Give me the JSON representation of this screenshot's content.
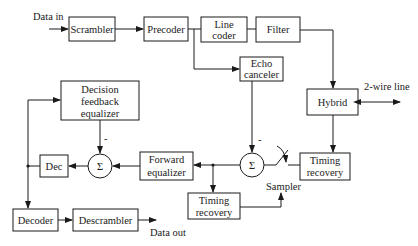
{
  "diagram": {
    "type": "block-diagram",
    "title": "",
    "labels": {
      "data_in": "Data in",
      "data_out": "Data out",
      "two_wire_line": "2-wire line",
      "sampler": "Sampler",
      "minus_sign": "-"
    },
    "blocks": {
      "scrambler": {
        "label": "Scrambler"
      },
      "precoder": {
        "label": "Precoder"
      },
      "line_coder": {
        "line1": "Line",
        "line2": "coder"
      },
      "filter": {
        "label": "Filter"
      },
      "echo_canceler": {
        "line1": "Echo",
        "line2": "canceler"
      },
      "hybrid": {
        "label": "Hybrid"
      },
      "dfe": {
        "line1": "Decision",
        "line2": "feedback",
        "line3": "equalizer"
      },
      "dec": {
        "label": "Dec"
      },
      "forward_equalizer": {
        "line1": "Forward",
        "line2": "equalizer"
      },
      "timing_recovery_upper": {
        "line1": "Timing",
        "line2": "recovery"
      },
      "timing_recovery_lower": {
        "line1": "Timing",
        "line2": "recovery"
      },
      "decoder": {
        "label": "Decoder"
      },
      "descrambler": {
        "label": "Descrambler"
      }
    },
    "summers": {
      "sum_dfe": {
        "symbol": "Σ"
      },
      "sum_echo": {
        "symbol": "Σ"
      }
    },
    "connections": [
      [
        "Data in",
        "Scrambler"
      ],
      [
        "Scrambler",
        "Precoder"
      ],
      [
        "Precoder",
        "Line coder"
      ],
      [
        "Precoder",
        "Echo canceler"
      ],
      [
        "Line coder",
        "Filter"
      ],
      [
        "Filter",
        "Hybrid"
      ],
      [
        "Hybrid",
        "2-wire line"
      ],
      [
        "Hybrid",
        "Timing recovery (upper)"
      ],
      [
        "Timing recovery (upper)",
        "Sampler"
      ],
      [
        "Sampler",
        "Σ (echo)"
      ],
      [
        "Echo canceler",
        "Σ (echo)"
      ],
      [
        "Σ (echo)",
        "Forward equalizer"
      ],
      [
        "Σ (echo)",
        "Timing recovery (lower)"
      ],
      [
        "Timing recovery (lower)",
        "Sampler"
      ],
      [
        "Forward equalizer",
        "Σ (dfe)"
      ],
      [
        "Decision feedback equalizer",
        "Σ (dfe)"
      ],
      [
        "Σ (dfe)",
        "Dec"
      ],
      [
        "Dec",
        "Decision feedback equalizer"
      ],
      [
        "Dec",
        "Decoder"
      ],
      [
        "Decoder",
        "Descrambler"
      ],
      [
        "Descrambler",
        "Data out"
      ]
    ]
  }
}
